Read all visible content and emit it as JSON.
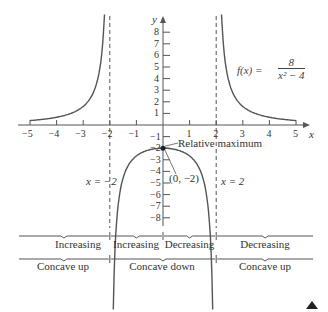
{
  "chart_data": {
    "type": "line",
    "title": "",
    "function_label": "f(x) = 8 / (x^2 - 4)",
    "function_numerator": "8",
    "function_denominator": "x² − 4",
    "function_prefix": "f(x) =",
    "xlabel": "x",
    "ylabel": "y",
    "xlim": [
      -5,
      5
    ],
    "ylim": [
      -8,
      8
    ],
    "x_ticks": [
      -5,
      -4,
      -3,
      -2,
      -1,
      1,
      2,
      3,
      4,
      5
    ],
    "y_ticks": [
      8,
      7,
      6,
      5,
      4,
      3,
      2,
      1,
      -1,
      -2,
      -3,
      -4,
      -5,
      -6,
      -7,
      -8
    ],
    "x_tick_labels": [
      "−5",
      "−4",
      "−3",
      "−2",
      "−1",
      "1",
      "2",
      "3",
      "4",
      "5"
    ],
    "y_tick_labels": [
      "8",
      "7",
      "6",
      "5",
      "4",
      "3",
      "2",
      "1",
      "−1",
      "−2",
      "−3",
      "−4",
      "−5",
      "−6",
      "−7",
      "−8"
    ],
    "grid": false,
    "asymptotes": [
      {
        "type": "vertical",
        "x": -2,
        "label": "x = −2"
      },
      {
        "type": "vertical",
        "x": 2,
        "label": "x = 2"
      }
    ],
    "series": [
      {
        "name": "left branch",
        "x": [
          -5,
          -4,
          -3,
          -2.5,
          -2.3,
          -2.2
        ],
        "y": [
          0.38,
          0.67,
          1.6,
          3.56,
          6.2,
          9.5
        ]
      },
      {
        "name": "middle branch",
        "x": [
          -1.85,
          -1.5,
          -1,
          0,
          1,
          1.5,
          1.85
        ],
        "y": [
          -8.3,
          -4.57,
          -2.67,
          -2,
          -2.67,
          -4.57,
          -8.3
        ]
      },
      {
        "name": "right branch",
        "x": [
          2.2,
          2.3,
          2.5,
          3,
          4,
          5
        ],
        "y": [
          9.5,
          6.2,
          3.56,
          1.6,
          0.67,
          0.38
        ]
      }
    ],
    "annotations": [
      {
        "text": "Relative maximum",
        "x": 0,
        "y": -2
      },
      {
        "text": "(0, −2)",
        "x": 0,
        "y": -2,
        "point": true
      }
    ],
    "intervals": {
      "monotonicity": [
        {
          "range": "(−∞, −2)",
          "label": "Increasing"
        },
        {
          "range": "(−2, 0)",
          "label": "Increasing"
        },
        {
          "range": "(0, 2)",
          "label": "Decreasing"
        },
        {
          "range": "(2, ∞)",
          "label": "Decreasing"
        }
      ],
      "concavity": [
        {
          "range": "(−∞, −2)",
          "label": "Concave up"
        },
        {
          "range": "(−2, 2)",
          "label": "Concave down"
        },
        {
          "range": "(2, ∞)",
          "label": "Concave up"
        }
      ]
    }
  },
  "labels": {
    "x_axis": "x",
    "y_axis": "y",
    "asymptote_left": "x = −2",
    "asymptote_right": "x = 2",
    "rel_max": "Relative maximum",
    "point": "(0, −2)",
    "f_prefix": "f(x) =",
    "f_num": "8",
    "f_den": "x² − 4"
  },
  "bands": {
    "mono": [
      "Increasing",
      "Increasing",
      "Decreasing",
      "Decreasing"
    ],
    "conc": [
      "Concave up",
      "Concave down",
      "Concave up"
    ]
  },
  "colors": {
    "curve": "#555555",
    "axis": "#555555",
    "text": "#333333"
  }
}
